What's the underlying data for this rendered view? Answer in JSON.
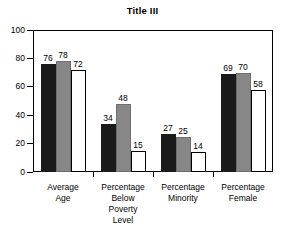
{
  "chart_data": {
    "type": "bar",
    "title": "Title III",
    "xlabel": "",
    "ylabel": "",
    "ylim": [
      0,
      100
    ],
    "yticks": [
      0,
      20,
      40,
      60,
      80,
      100
    ],
    "grid": false,
    "legend": null,
    "categories": [
      "Average Age",
      "Percentage Below Poverty Level",
      "Percentage Minority",
      "Percentage Female"
    ],
    "category_lines": [
      [
        "Average",
        "Age"
      ],
      [
        "Percentage",
        "Below",
        "Poverty",
        "Level"
      ],
      [
        "Percentage",
        "Minority"
      ],
      [
        "Percentage",
        "Female"
      ]
    ],
    "series": [
      {
        "name": "Series 1",
        "color": "#1a1a1a",
        "values": [
          76,
          34,
          27,
          69
        ]
      },
      {
        "name": "Series 2",
        "color": "#878787",
        "values": [
          78,
          48,
          25,
          70
        ]
      },
      {
        "name": "Series 3",
        "color": "#ffffff",
        "values": [
          72,
          15,
          14,
          58
        ]
      }
    ],
    "data_labels": [
      [
        "76",
        "78",
        "72"
      ],
      [
        "34",
        "48",
        "15"
      ],
      [
        "27",
        "25",
        "14"
      ],
      [
        "69",
        "70",
        "58"
      ]
    ],
    "ytick_labels": [
      "0",
      "20",
      "40",
      "60",
      "80",
      "100"
    ]
  }
}
